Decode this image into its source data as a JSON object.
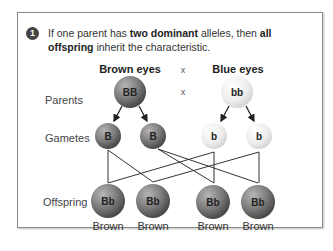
{
  "step_number": "1",
  "caption": {
    "part1": "If one parent has ",
    "bold1": "two dominant",
    "part2": " alleles, then ",
    "bold2": "all offspring",
    "part3": " inherit the characteristic."
  },
  "parents_header": {
    "left": "Brown eyes",
    "cross": "x",
    "right": "Blue eyes"
  },
  "row_labels": {
    "parents": "Parents",
    "gametes": "Gametes",
    "offspring": "Offspring"
  },
  "cross_symbol": "x",
  "parents": [
    {
      "genotype": "BB",
      "color": "#7a7a7a"
    },
    {
      "genotype": "bb",
      "color": "#ececec"
    }
  ],
  "gametes": [
    {
      "allele": "B",
      "color": "#7a7a7a"
    },
    {
      "allele": "B",
      "color": "#7a7a7a"
    },
    {
      "allele": "b",
      "color": "#ececec"
    },
    {
      "allele": "b",
      "color": "#ececec"
    }
  ],
  "offspring": [
    {
      "genotype": "Bb",
      "phenotype": "Brown"
    },
    {
      "genotype": "Bb",
      "phenotype": "Brown"
    },
    {
      "genotype": "Bb",
      "phenotype": "Brown"
    },
    {
      "genotype": "Bb",
      "phenotype": "Brown"
    }
  ]
}
